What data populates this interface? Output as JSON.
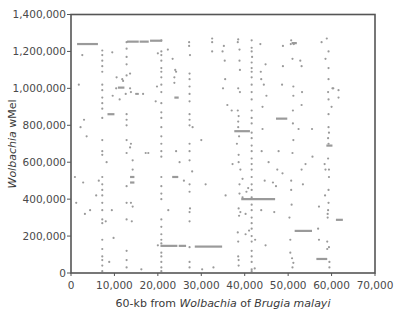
{
  "chart_data": {
    "type": "scatter",
    "title": "",
    "xlabel": "60-kb from Wolbachia of Brugia malayi",
    "xlabel_parts": [
      {
        "text": "60-kb from ",
        "italic": false
      },
      {
        "text": "Wolbachia",
        "italic": true
      },
      {
        "text": " of ",
        "italic": false
      },
      {
        "text": "Brugia malayi",
        "italic": true
      }
    ],
    "ylabel": "Wolbachia wMel",
    "ylabel_parts": [
      {
        "text": "Wolbachia",
        "italic": true
      },
      {
        "text": " wMel",
        "italic": false
      }
    ],
    "xlim": [
      0,
      70000
    ],
    "ylim": [
      0,
      1400000
    ],
    "x_ticks": [
      0,
      10000,
      20000,
      30000,
      40000,
      50000,
      60000,
      70000
    ],
    "x_tick_labels": [
      "0",
      "10,000",
      "20,000",
      "30,000",
      "40,000",
      "50,000",
      "60,000",
      "70,000"
    ],
    "y_ticks": [
      0,
      200000,
      400000,
      600000,
      800000,
      1000000,
      1200000,
      1400000
    ],
    "y_tick_labels": [
      "0",
      "200,000",
      "400,000",
      "600,000",
      "800,000",
      "1,000,000",
      "1,200,000",
      "1,400,000"
    ],
    "grid": false,
    "legend": null,
    "marker_color": "#9a9a9a",
    "segments": [
      {
        "x0": 1400,
        "x1": 6200,
        "y": 1240000
      },
      {
        "x0": 12900,
        "x1": 15600,
        "y": 1253000
      },
      {
        "x0": 15800,
        "x1": 17900,
        "y": 1253000
      },
      {
        "x0": 18200,
        "x1": 21000,
        "y": 1258000
      },
      {
        "x0": 8400,
        "x1": 10000,
        "y": 860000
      },
      {
        "x0": 10800,
        "x1": 12300,
        "y": 1004000
      },
      {
        "x0": 13600,
        "x1": 14600,
        "y": 520000
      },
      {
        "x0": 13600,
        "x1": 14600,
        "y": 490000
      },
      {
        "x0": 23800,
        "x1": 24800,
        "y": 950000
      },
      {
        "x0": 23300,
        "x1": 24700,
        "y": 520000
      },
      {
        "x0": 20600,
        "x1": 24500,
        "y": 147000
      },
      {
        "x0": 24800,
        "x1": 26500,
        "y": 147000
      },
      {
        "x0": 28500,
        "x1": 34800,
        "y": 143000
      },
      {
        "x0": 37600,
        "x1": 41200,
        "y": 768000
      },
      {
        "x0": 39200,
        "x1": 47000,
        "y": 400000
      },
      {
        "x0": 47200,
        "x1": 49800,
        "y": 836000
      },
      {
        "x0": 50800,
        "x1": 52000,
        "y": 1245000
      },
      {
        "x0": 51500,
        "x1": 55500,
        "y": 228000
      },
      {
        "x0": 56500,
        "x1": 59000,
        "y": 76000
      },
      {
        "x0": 58800,
        "x1": 60200,
        "y": 690000
      },
      {
        "x0": 61000,
        "x1": 62600,
        "y": 288000
      }
    ],
    "points": [
      [
        1800,
        1020000
      ],
      [
        2600,
        1180000
      ],
      [
        2200,
        790000
      ],
      [
        3000,
        830000
      ],
      [
        3600,
        740000
      ],
      [
        1200,
        380000
      ],
      [
        900,
        520000
      ],
      [
        2800,
        490000
      ],
      [
        4400,
        340000
      ],
      [
        3200,
        320000
      ],
      [
        5800,
        420000
      ],
      [
        6400,
        500000
      ],
      [
        7200,
        1205000
      ],
      [
        7200,
        1180000
      ],
      [
        7200,
        1150000
      ],
      [
        7200,
        1120000
      ],
      [
        7200,
        1090000
      ],
      [
        7200,
        1020000
      ],
      [
        7200,
        990000
      ],
      [
        7200,
        950000
      ],
      [
        7200,
        920000
      ],
      [
        7200,
        890000
      ],
      [
        7200,
        840000
      ],
      [
        7200,
        720000
      ],
      [
        7200,
        660000
      ],
      [
        7200,
        640000
      ],
      [
        7200,
        520000
      ],
      [
        7200,
        480000
      ],
      [
        7200,
        450000
      ],
      [
        7200,
        420000
      ],
      [
        7200,
        380000
      ],
      [
        7200,
        340000
      ],
      [
        7200,
        290000
      ],
      [
        7200,
        270000
      ],
      [
        7200,
        180000
      ],
      [
        7200,
        130000
      ],
      [
        7200,
        90000
      ],
      [
        7200,
        70000
      ],
      [
        7200,
        40000
      ],
      [
        7200,
        10000
      ],
      [
        8000,
        280000
      ],
      [
        8200,
        600000
      ],
      [
        9400,
        340000
      ],
      [
        9800,
        190000
      ],
      [
        8800,
        60000
      ],
      [
        9500,
        1195000
      ],
      [
        10500,
        1060000
      ],
      [
        9600,
        960000
      ],
      [
        10400,
        1000000
      ],
      [
        11200,
        940000
      ],
      [
        11800,
        1050000
      ],
      [
        12000,
        1040000
      ],
      [
        12600,
        970000
      ],
      [
        13600,
        1000000
      ],
      [
        13800,
        980000
      ],
      [
        12800,
        1250000
      ],
      [
        12800,
        1215000
      ],
      [
        12800,
        1170000
      ],
      [
        12800,
        1130000
      ],
      [
        12800,
        1070000
      ],
      [
        12800,
        860000
      ],
      [
        12800,
        830000
      ],
      [
        12800,
        800000
      ],
      [
        12800,
        720000
      ],
      [
        12800,
        650000
      ],
      [
        12800,
        470000
      ],
      [
        12800,
        380000
      ],
      [
        12800,
        290000
      ],
      [
        12800,
        120000
      ],
      [
        12800,
        70000
      ],
      [
        12800,
        30000
      ],
      [
        13600,
        1080000
      ],
      [
        13800,
        700000
      ],
      [
        13600,
        680000
      ],
      [
        14200,
        610000
      ],
      [
        14200,
        560000
      ],
      [
        13800,
        380000
      ],
      [
        14200,
        360000
      ],
      [
        14000,
        280000
      ],
      [
        15000,
        970000
      ],
      [
        15400,
        970000
      ],
      [
        16600,
        970000
      ],
      [
        16200,
        20000
      ],
      [
        17200,
        650000
      ],
      [
        17800,
        650000
      ],
      [
        20000,
        150000
      ],
      [
        19800,
        1010000
      ],
      [
        19500,
        930000
      ],
      [
        20000,
        1190000
      ],
      [
        20800,
        1180000
      ],
      [
        20800,
        1260000
      ],
      [
        20800,
        1200000
      ],
      [
        20800,
        1150000
      ],
      [
        20800,
        1110000
      ],
      [
        20800,
        1090000
      ],
      [
        20800,
        1060000
      ],
      [
        20800,
        1020000
      ],
      [
        20800,
        980000
      ],
      [
        20800,
        920000
      ],
      [
        20800,
        870000
      ],
      [
        20800,
        840000
      ],
      [
        20800,
        790000
      ],
      [
        20800,
        740000
      ],
      [
        20800,
        700000
      ],
      [
        20800,
        660000
      ],
      [
        20800,
        630000
      ],
      [
        20800,
        520000
      ],
      [
        20800,
        470000
      ],
      [
        20800,
        430000
      ],
      [
        20800,
        400000
      ],
      [
        20800,
        290000
      ],
      [
        20800,
        250000
      ],
      [
        20800,
        210000
      ],
      [
        20800,
        180000
      ],
      [
        20800,
        160000
      ],
      [
        20800,
        110000
      ],
      [
        20800,
        90000
      ],
      [
        20800,
        60000
      ],
      [
        20800,
        30000
      ],
      [
        20800,
        10000
      ],
      [
        22300,
        1210000
      ],
      [
        23400,
        1160000
      ],
      [
        24000,
        1100000
      ],
      [
        24200,
        1090000
      ],
      [
        23800,
        1060000
      ],
      [
        23800,
        1030000
      ],
      [
        22400,
        340000
      ],
      [
        25000,
        600000
      ],
      [
        24200,
        660000
      ],
      [
        27200,
        1250000
      ],
      [
        27200,
        1230000
      ],
      [
        27400,
        1180000
      ],
      [
        27300,
        1080000
      ],
      [
        27300,
        1050000
      ],
      [
        27300,
        1010000
      ],
      [
        27300,
        970000
      ],
      [
        27300,
        930000
      ],
      [
        27300,
        860000
      ],
      [
        27300,
        830000
      ],
      [
        27300,
        800000
      ],
      [
        27300,
        700000
      ],
      [
        27300,
        660000
      ],
      [
        27300,
        610000
      ],
      [
        27300,
        480000
      ],
      [
        27300,
        440000
      ],
      [
        27300,
        330000
      ],
      [
        27300,
        280000
      ],
      [
        27300,
        140000
      ],
      [
        27300,
        60000
      ],
      [
        27300,
        30000
      ],
      [
        28000,
        790000
      ],
      [
        27900,
        550000
      ],
      [
        26000,
        500000
      ],
      [
        27400,
        350000
      ],
      [
        30000,
        720000
      ],
      [
        32500,
        1270000
      ],
      [
        32500,
        1250000
      ],
      [
        32500,
        1200000
      ],
      [
        31000,
        480000
      ],
      [
        32800,
        30000
      ],
      [
        30200,
        20000
      ],
      [
        35000,
        1000000
      ],
      [
        35200,
        1230000
      ],
      [
        35400,
        1150000
      ],
      [
        35500,
        1050000
      ],
      [
        35600,
        420000
      ],
      [
        34900,
        1200000
      ],
      [
        36000,
        910000
      ],
      [
        37000,
        880000
      ],
      [
        38200,
        700000
      ],
      [
        37200,
        590000
      ],
      [
        38500,
        1265000
      ],
      [
        38400,
        1250000
      ],
      [
        38800,
        1210000
      ],
      [
        38800,
        1150000
      ],
      [
        38900,
        1100000
      ],
      [
        38500,
        1000000
      ],
      [
        38900,
        980000
      ],
      [
        38400,
        880000
      ],
      [
        38600,
        850000
      ],
      [
        38500,
        820000
      ],
      [
        38500,
        790000
      ],
      [
        38700,
        740000
      ],
      [
        38600,
        640000
      ],
      [
        38600,
        600000
      ],
      [
        39000,
        560000
      ],
      [
        39500,
        510000
      ],
      [
        38800,
        480000
      ],
      [
        38800,
        430000
      ],
      [
        38600,
        350000
      ],
      [
        39000,
        330000
      ],
      [
        38700,
        310000
      ],
      [
        38400,
        220000
      ],
      [
        38500,
        170000
      ],
      [
        38500,
        90000
      ],
      [
        38600,
        70000
      ],
      [
        38600,
        40000
      ],
      [
        41600,
        1260000
      ],
      [
        41600,
        1220000
      ],
      [
        41600,
        1200000
      ],
      [
        41700,
        1170000
      ],
      [
        41600,
        1140000
      ],
      [
        41600,
        1110000
      ],
      [
        41600,
        1090000
      ],
      [
        41600,
        1060000
      ],
      [
        41600,
        1020000
      ],
      [
        41600,
        980000
      ],
      [
        41600,
        940000
      ],
      [
        41600,
        880000
      ],
      [
        41600,
        840000
      ],
      [
        41600,
        810000
      ],
      [
        41600,
        760000
      ],
      [
        41600,
        730000
      ],
      [
        41600,
        690000
      ],
      [
        41600,
        660000
      ],
      [
        41600,
        620000
      ],
      [
        41600,
        590000
      ],
      [
        41600,
        560000
      ],
      [
        41600,
        520000
      ],
      [
        41600,
        480000
      ],
      [
        41600,
        450000
      ],
      [
        41600,
        410000
      ],
      [
        41600,
        370000
      ],
      [
        41600,
        340000
      ],
      [
        41600,
        300000
      ],
      [
        41600,
        270000
      ],
      [
        41600,
        240000
      ],
      [
        41600,
        200000
      ],
      [
        41600,
        170000
      ],
      [
        41600,
        120000
      ],
      [
        41600,
        90000
      ],
      [
        41600,
        60000
      ],
      [
        41600,
        20000
      ],
      [
        40800,
        460000
      ],
      [
        40400,
        440000
      ],
      [
        39500,
        410000
      ],
      [
        40200,
        320000
      ],
      [
        41000,
        230000
      ],
      [
        40200,
        210000
      ],
      [
        42400,
        180000
      ],
      [
        42300,
        25000
      ],
      [
        41600,
        10000
      ],
      [
        43600,
        1240000
      ],
      [
        43700,
        1090000
      ],
      [
        43800,
        1050000
      ],
      [
        44400,
        1020000
      ],
      [
        45000,
        960000
      ],
      [
        44100,
        900000
      ],
      [
        44100,
        780000
      ],
      [
        44800,
        1130000
      ],
      [
        43900,
        660000
      ],
      [
        45500,
        600000
      ],
      [
        44800,
        150000
      ],
      [
        43800,
        340000
      ],
      [
        44600,
        500000
      ],
      [
        46800,
        330000
      ],
      [
        46500,
        490000
      ],
      [
        47500,
        560000
      ],
      [
        47200,
        470000
      ],
      [
        48700,
        540000
      ],
      [
        48800,
        1230000
      ],
      [
        48800,
        1120000
      ],
      [
        48600,
        1020000
      ],
      [
        47800,
        660000
      ],
      [
        50700,
        1260000
      ],
      [
        50600,
        1240000
      ],
      [
        51300,
        1240000
      ],
      [
        51000,
        1160000
      ],
      [
        51200,
        1010000
      ],
      [
        51200,
        960000
      ],
      [
        51100,
        880000
      ],
      [
        51100,
        810000
      ],
      [
        51200,
        720000
      ],
      [
        51000,
        650000
      ],
      [
        50700,
        500000
      ],
      [
        50700,
        450000
      ],
      [
        50800,
        370000
      ],
      [
        50300,
        300000
      ],
      [
        50500,
        180000
      ],
      [
        50500,
        110000
      ],
      [
        50900,
        80000
      ],
      [
        51200,
        55000
      ],
      [
        51000,
        30000
      ],
      [
        53200,
        980000
      ],
      [
        53100,
        910000
      ],
      [
        52400,
        780000
      ],
      [
        52800,
        1150000
      ],
      [
        53100,
        1120000
      ],
      [
        53100,
        560000
      ],
      [
        53400,
        480000
      ],
      [
        55600,
        630000
      ],
      [
        55500,
        780000
      ],
      [
        54000,
        590000
      ],
      [
        57100,
        360000
      ],
      [
        58900,
        1270000
      ],
      [
        57700,
        1250000
      ],
      [
        59300,
        1200000
      ],
      [
        58600,
        1160000
      ],
      [
        59300,
        1110000
      ],
      [
        59300,
        1050000
      ],
      [
        59200,
        980000
      ],
      [
        59300,
        940000
      ],
      [
        60000,
        900000
      ],
      [
        59300,
        860000
      ],
      [
        59300,
        790000
      ],
      [
        59400,
        760000
      ],
      [
        59200,
        730000
      ],
      [
        59300,
        700000
      ],
      [
        59200,
        620000
      ],
      [
        59400,
        560000
      ],
      [
        59400,
        520000
      ],
      [
        59300,
        450000
      ],
      [
        59300,
        380000
      ],
      [
        59200,
        340000
      ],
      [
        59100,
        320000
      ],
      [
        59000,
        170000
      ],
      [
        59000,
        130000
      ],
      [
        58400,
        590000
      ],
      [
        58600,
        560000
      ],
      [
        58500,
        420000
      ],
      [
        59100,
        300000
      ],
      [
        59400,
        140000
      ],
      [
        59500,
        60000
      ],
      [
        59500,
        30000
      ],
      [
        57100,
        180000
      ],
      [
        56900,
        240000
      ],
      [
        60400,
        1000000
      ],
      [
        60200,
        1000000
      ],
      [
        61600,
        950000
      ],
      [
        61600,
        990000
      ]
    ]
  }
}
